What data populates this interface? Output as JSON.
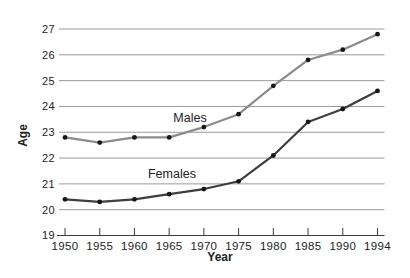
{
  "chart_data": {
    "type": "line",
    "title": "",
    "xlabel": "Year",
    "ylabel": "Age",
    "x_categories": [
      "1950",
      "1955",
      "1960",
      "1965",
      "1970",
      "1975",
      "1980",
      "1985",
      "1990",
      "1994"
    ],
    "yticks": [
      19,
      20,
      21,
      22,
      23,
      24,
      25,
      26,
      27
    ],
    "ylim": [
      19,
      27
    ],
    "grid": "horizontal-only",
    "x_tick_spacing": "equal",
    "legend": "inline-series-labels",
    "series": [
      {
        "name": "Males",
        "values": [
          22.8,
          22.6,
          22.8,
          22.8,
          23.2,
          23.7,
          24.8,
          25.8,
          26.2,
          26.8
        ],
        "color": "#8b8b8b",
        "label_anchor": {
          "x_index": 3.6,
          "y_value": 23.55
        }
      },
      {
        "name": "Females",
        "values": [
          20.4,
          20.3,
          20.4,
          20.6,
          20.8,
          21.1,
          22.1,
          23.4,
          23.9,
          24.6
        ],
        "color": "#3e3e3e",
        "label_anchor": {
          "x_index": 3.08,
          "y_value": 21.4
        }
      }
    ],
    "point_color": "#161616",
    "colors": {
      "background": "#ffffff",
      "grid": "#9a9a9a",
      "axis": "#3c3c3c",
      "text": "#222222"
    }
  }
}
